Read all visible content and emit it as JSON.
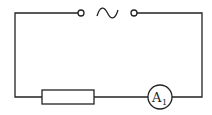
{
  "diagram": {
    "type": "circuit",
    "components": [
      {
        "id": "ac-source",
        "symbol": "~",
        "kind": "AC power supply terminals"
      },
      {
        "id": "resistor",
        "kind": "resistor"
      },
      {
        "id": "ammeter",
        "label": "A",
        "subscript": "1",
        "kind": "ammeter"
      }
    ],
    "ammeter": {
      "letter": "A",
      "subscript": "1"
    }
  }
}
